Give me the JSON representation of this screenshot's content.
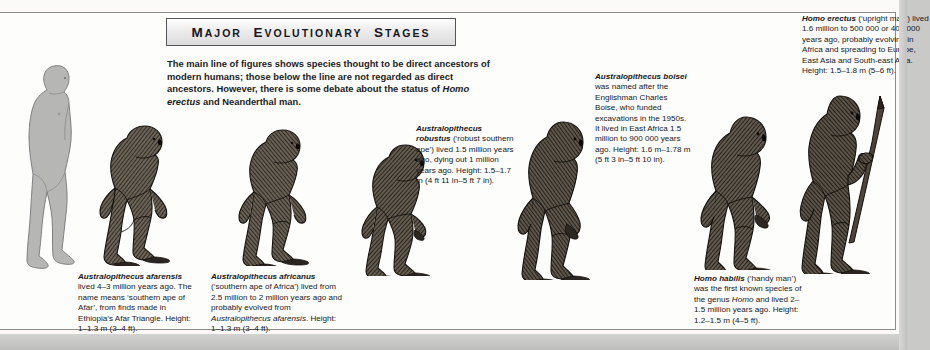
{
  "page": {
    "title_display": "MAJOR EVOLUTIONARY STAGES",
    "intro": "The main line of figures shows species thought to be direct ancestors of modern humans; those below the line are not regarded as direct ancestors. However, there is some debate about the status of Homo erectus and Neanderthal man.",
    "background_color": "#fdfdfb",
    "border_color": "#8d8d8b",
    "banner_border_color": "#55555a"
  },
  "captions": {
    "afarensis": {
      "species": "Australopithecus afarensis",
      "text": "lived 4–3 million years ago. The name means ‘southern ape of Afar’, from finds made in Ethiopia’s Afar Triangle. Height: 1–1.3 m (3–4 ft)."
    },
    "africanus": {
      "species": "Australopithecus africanus",
      "text": "(‘southern ape of Africa’) lived from 2.5 million to 2 million years ago and probably evolved from Australopithecus afarensis. Height: 1–1.3 m (3–4 ft).",
      "italic_ref": "Australopithecus afarensis"
    },
    "robustus": {
      "species": "Australopithecus robustus",
      "text": "(‘robust southern ape’) lived 1.5 million years ago, dying out 1 million years ago. Height: 1.5–1.7 m (4 ft 11 in–5 ft 7 in)."
    },
    "boisei": {
      "species": "Australopithecus boisei",
      "text": "was named after the Englishman Charles Boise, who funded excavations in the 1950s. It lived in East Africa 1.5 million to 900 000 years ago. Height: 1.6 m–1.78 m (5 ft 3 in–5 ft 10 in)."
    },
    "habilis": {
      "species": "Homo habilis",
      "text": "(‘handy man’) was the first known species of the genus Homo and lived 2–1.5 million years ago. Height: 1.2–1.5 m (4–5 ft).",
      "italic_ref": "Homo"
    },
    "erectus": {
      "species": "Homo erectus",
      "text": "(‘upright man’) lived 1.6 million to 500 000 or 400 000 years ago, probably evolving in Africa and spreading to Europe, East Asia and South-east Asia. Height: 1.5–1.8 m (5–6 ft)."
    }
  },
  "figures": [
    {
      "name": "modern-human-silhouette",
      "label": "Modern human"
    },
    {
      "name": "australopithecus-afarensis",
      "label": "Australopithecus afarensis"
    },
    {
      "name": "australopithecus-africanus",
      "label": "Australopithecus africanus"
    },
    {
      "name": "australopithecus-robustus",
      "label": "Australopithecus robustus"
    },
    {
      "name": "australopithecus-boisei",
      "label": "Australopithecus boisei"
    },
    {
      "name": "homo-habilis",
      "label": "Homo habilis"
    },
    {
      "name": "homo-erectus",
      "label": "Homo erectus"
    }
  ]
}
